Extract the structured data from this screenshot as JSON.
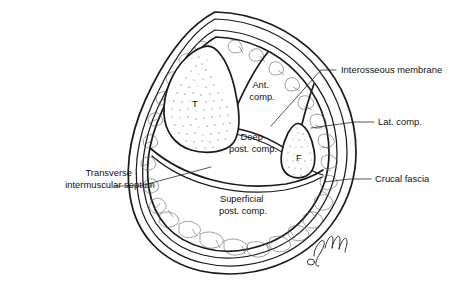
{
  "figure": {
    "view": "Transverse cross-section (right leg, mid-calf)",
    "ink_color": "#1a1a1a",
    "background_color": "#ffffff",
    "signature": "artist-monogram"
  },
  "bone_labels": [
    {
      "id": "tibia",
      "letter": "T",
      "x": 195,
      "y": 103,
      "meaning": "Tibia"
    },
    {
      "id": "fibula",
      "letter": "F",
      "x": 303,
      "y": 158,
      "meaning": "Fibula"
    }
  ],
  "interior_labels": [
    {
      "id": "ant-comp",
      "lines": [
        "Ant.",
        "comp."
      ],
      "x": 262,
      "y": 88,
      "line_height": 12
    },
    {
      "id": "deep-post-comp",
      "lines": [
        "Deep",
        "post. comp."
      ],
      "x": 253,
      "y": 140,
      "line_height": 12
    },
    {
      "id": "superficial-post-comp",
      "lines": [
        "Superficial",
        "post. comp."
      ],
      "x": 243,
      "y": 202,
      "line_height": 12
    }
  ],
  "callouts": [
    {
      "id": "interosseous-membrane",
      "text": "Interosseous membrane",
      "side": "right",
      "text_x": 341,
      "text_y": 73,
      "leader": [
        [
          336,
          70
        ],
        [
          320,
          70
        ],
        [
          271,
          126
        ]
      ]
    },
    {
      "id": "lat-comp",
      "text": "Lat. comp.",
      "side": "right",
      "text_x": 378,
      "text_y": 125,
      "leader": [
        [
          374,
          122
        ],
        [
          354,
          122
        ],
        [
          311,
          128
        ]
      ]
    },
    {
      "id": "crucal-fascia",
      "text": "Crucal fascia",
      "side": "right",
      "text_x": 375,
      "text_y": 182,
      "leader": [
        [
          371,
          179
        ],
        [
          350,
          179
        ],
        [
          325,
          182
        ]
      ]
    },
    {
      "id": "transverse-intermuscular-septum",
      "text": "Transverse intermuscular septum",
      "lines": [
        "Transverse",
        "intermuscular septum"
      ],
      "side": "left",
      "text_x": 110,
      "text_y": 176,
      "line_height": 12,
      "leader": [
        [
          115,
          186
        ],
        [
          139,
          186
        ],
        [
          210,
          167
        ]
      ]
    }
  ],
  "layers": [
    {
      "id": "skin",
      "description": "Outermost skin line"
    },
    {
      "id": "subcutaneous-fat",
      "description": "Lobular subcutaneous fat between skin and deep fascia"
    },
    {
      "id": "deep-fascia",
      "description": "Crucal (deep) fascia enclosing the muscle compartments"
    }
  ]
}
